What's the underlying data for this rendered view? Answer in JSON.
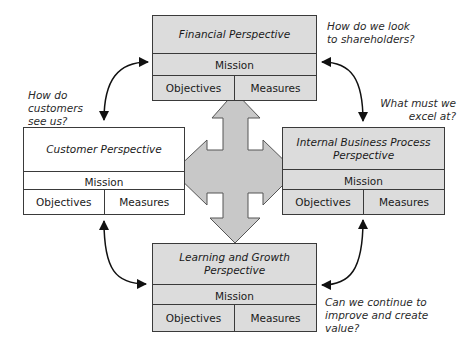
{
  "diagram": {
    "type": "balanced-scorecard",
    "perspectives": [
      {
        "id": "financial",
        "title": "Financial Perspective",
        "mission": "Mission",
        "objectives": "Objectives",
        "measures": "Measures",
        "question": "How do we look to shareholders?"
      },
      {
        "id": "customer",
        "title": "Customer Perspective",
        "mission": "Mission",
        "objectives": "Objectives",
        "measures": "Measures",
        "question": "How do customers see us?"
      },
      {
        "id": "internal",
        "title": "Internal Business Process Perspective",
        "mission": "Mission",
        "objectives": "Objectives",
        "measures": "Measures",
        "question": "What must we excel at?"
      },
      {
        "id": "learning",
        "title": "Learning and Growth Perspective",
        "mission": "Mission",
        "objectives": "Objectives",
        "measures": "Measures",
        "question": "Can we continue to improve and create value?"
      }
    ],
    "questions": {
      "financial_l1": "How do we look",
      "financial_l2": "to shareholders?",
      "customer_l1": "How do",
      "customer_l2": "customers",
      "customer_l3": "see us?",
      "internal_l1": "What must we",
      "internal_l2": "excel at?",
      "learning_l1": "Can we continue to",
      "learning_l2": "improve and create",
      "learning_l3": "value?"
    },
    "titles": {
      "internal_l1": "Internal Business Process",
      "internal_l2": "Perspective",
      "learning_l1": "Learning and Growth",
      "learning_l2": "Perspective"
    },
    "colors": {
      "box_gray": "#dcdcdc",
      "box_white": "#ffffff",
      "cross_arrow": "#c8c8c8",
      "outline": "#3a3a3a",
      "connector": "#111111"
    }
  }
}
